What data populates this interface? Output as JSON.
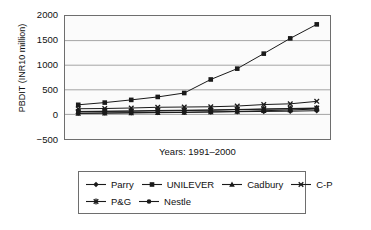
{
  "chart_data": {
    "type": "line",
    "title": "",
    "xlabel": "Years: 1991–2000",
    "ylabel": "PBDIT (INR10 million)",
    "categories": [
      "1991",
      "1992",
      "1993",
      "1994",
      "1995",
      "1996",
      "1997",
      "1998",
      "1999",
      "2000"
    ],
    "x": [
      1991,
      1992,
      1993,
      1994,
      1995,
      1996,
      1997,
      1998,
      1999,
      2000
    ],
    "ylim": [
      -500,
      2000
    ],
    "yticks": [
      2000,
      1500,
      1000,
      500,
      0,
      -500
    ],
    "ytick_labels": [
      "2000",
      "1500",
      "1000",
      "500",
      "0",
      "−500"
    ],
    "grid": "horizontal",
    "legend_position": "bottom",
    "series": [
      {
        "name": "Parry",
        "marker": "diamond",
        "color": "#1a1a1a",
        "values": [
          25,
          30,
          35,
          40,
          45,
          50,
          55,
          60,
          65,
          75
        ]
      },
      {
        "name": "UNILEVER",
        "marker": "square",
        "color": "#1a1a1a",
        "values": [
          195,
          240,
          295,
          355,
          435,
          710,
          930,
          1235,
          1545,
          1830
        ]
      },
      {
        "name": "Cadbury",
        "marker": "triangle",
        "color": "#1a1a1a",
        "values": [
          20,
          25,
          30,
          35,
          40,
          50,
          60,
          75,
          90,
          110
        ]
      },
      {
        "name": "C-P",
        "marker": "cross",
        "color": "#1a1a1a",
        "values": [
          115,
          120,
          130,
          145,
          150,
          155,
          170,
          200,
          215,
          265
        ]
      },
      {
        "name": "P&G",
        "marker": "star",
        "color": "#1a1a1a",
        "values": [
          60,
          65,
          70,
          80,
          85,
          90,
          100,
          110,
          120,
          130
        ]
      },
      {
        "name": "Nestle",
        "marker": "circle",
        "color": "#1a1a1a",
        "values": [
          55,
          60,
          65,
          70,
          78,
          85,
          95,
          105,
          112,
          122
        ]
      }
    ]
  },
  "axes": {
    "y_label": "PBDIT (INR10 million)",
    "x_label": "Years: 1991–2000",
    "ticks": [
      "2000",
      "1500",
      "1000",
      "500",
      "0",
      "−500"
    ]
  },
  "legend": {
    "row1": [
      {
        "label": "Parry",
        "marker": "diamond"
      },
      {
        "label": "UNILEVER",
        "marker": "square"
      },
      {
        "label": "Cadbury",
        "marker": "triangle"
      },
      {
        "label": "C-P",
        "marker": "cross"
      }
    ],
    "row2": [
      {
        "label": "P&G",
        "marker": "star"
      },
      {
        "label": "Nestle",
        "marker": "circle"
      }
    ]
  },
  "colors": {
    "line": "#1a1a1a",
    "grid": "#9a9a9a",
    "frame": "#6e6e6e",
    "plot_bg": "#fbfbfb"
  }
}
